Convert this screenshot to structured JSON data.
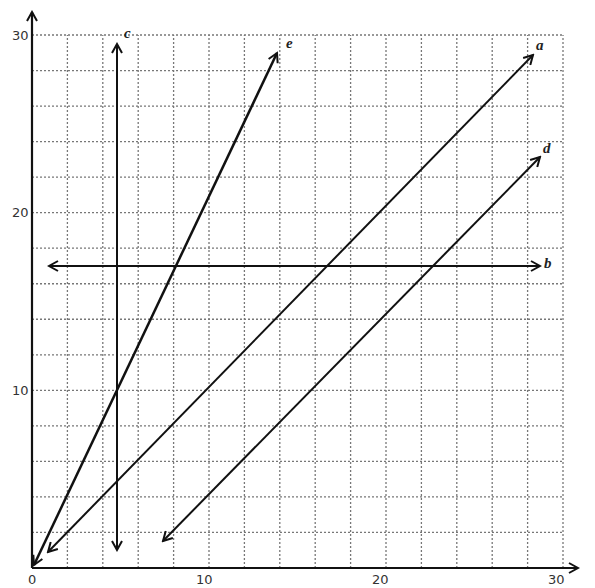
{
  "chart_data": {
    "type": "line",
    "title": "",
    "xlabel": "",
    "ylabel": "",
    "xlim": [
      0,
      30
    ],
    "ylim": [
      0,
      30
    ],
    "grid": true,
    "grid_step": 2,
    "x_ticks": [
      "0",
      "10",
      "20",
      "30"
    ],
    "y_ticks": [
      "10",
      "20",
      "30"
    ],
    "series": [
      {
        "name": "a",
        "equation": "y = x",
        "x": [
          0.9,
          28.4
        ],
        "y": [
          0.9,
          28.8
        ]
      },
      {
        "name": "b",
        "equation": "y = 17",
        "x": [
          1,
          29
        ],
        "y": [
          17,
          17
        ]
      },
      {
        "name": "c",
        "equation": "x = 5",
        "x": [
          5,
          5
        ],
        "y": [
          1,
          29.5
        ]
      },
      {
        "name": "d",
        "equation": "y = x - 6",
        "x": [
          7.4,
          28.8
        ],
        "y": [
          1.5,
          23
        ]
      },
      {
        "name": "e",
        "equation": "y = 2x",
        "x": [
          0,
          14.1
        ],
        "y": [
          0,
          29
        ]
      }
    ]
  },
  "labels": {
    "x0": "0",
    "x10": "10",
    "x20": "20",
    "x30": "30",
    "y10": "10",
    "y20": "20",
    "y30": "30",
    "a": "a",
    "b": "b",
    "c": "c",
    "d": "d",
    "e": "e"
  }
}
